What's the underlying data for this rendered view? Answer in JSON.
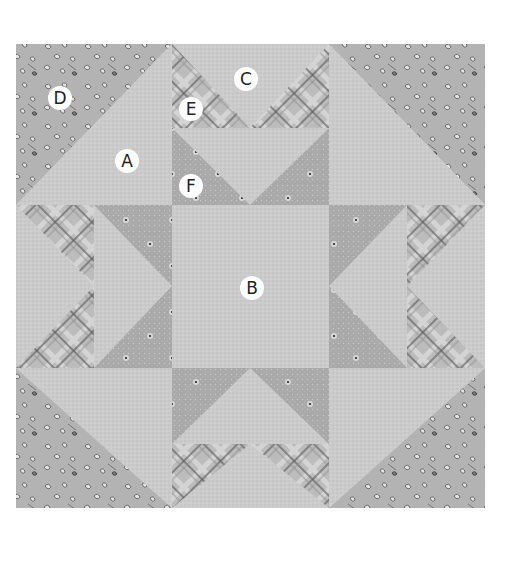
{
  "figure": {
    "labels": [
      {
        "letter": "A",
        "x": 127,
        "y": 161
      },
      {
        "letter": "B",
        "x": 252,
        "y": 288
      },
      {
        "letter": "C",
        "x": 246,
        "y": 79
      },
      {
        "letter": "D",
        "x": 60,
        "y": 98
      },
      {
        "letter": "E",
        "x": 191,
        "y": 109
      },
      {
        "letter": "F",
        "x": 191,
        "y": 186
      }
    ]
  },
  "colors": {
    "background": "#ffffff",
    "light_dot": "#c9c9c9",
    "medium_dot": "#a8a8a8",
    "floral": "#b3b3b3",
    "plaid_base": "#bdbdbd",
    "plaid_line": "#555555",
    "label_bg": "#ffffff",
    "label_text": "#222222"
  }
}
